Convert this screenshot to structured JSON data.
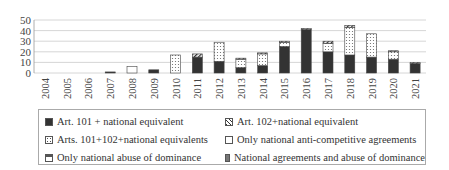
{
  "chart_data": {
    "type": "bar",
    "stacked": true,
    "title": "",
    "xlabel": "",
    "ylabel": "",
    "ylim": [
      0,
      50
    ],
    "yticks": [
      0,
      10,
      20,
      30,
      40,
      50
    ],
    "grid": true,
    "legend_position": "bottom",
    "categories": [
      "2004",
      "2005",
      "2006",
      "2007",
      "2008",
      "2009",
      "2010",
      "2011",
      "2012",
      "2013",
      "2014",
      "2015",
      "2016",
      "2017",
      "2018",
      "2019",
      "2020",
      "2021"
    ],
    "series": [
      {
        "name": "Art. 101 + national equivalent",
        "color": "#333333",
        "pattern": "solid",
        "values": [
          0,
          0,
          0,
          1,
          0,
          3,
          0,
          15,
          11,
          5,
          7,
          25,
          41,
          20,
          17,
          15,
          13,
          9
        ]
      },
      {
        "name": "Arts. 101+102+national equivalents",
        "color": "#ffffff",
        "pattern": "dotted",
        "values": [
          0,
          0,
          0,
          0,
          0,
          0,
          17,
          0,
          18,
          8,
          11,
          4,
          0,
          8,
          26,
          22,
          7,
          0
        ]
      },
      {
        "name": "Art. 102+national equivalent",
        "color": "#333333",
        "pattern": "hatched",
        "values": [
          0,
          0,
          0,
          0,
          0,
          0,
          0,
          3,
          0,
          1,
          1,
          1,
          1,
          2,
          2,
          0,
          1,
          1
        ]
      },
      {
        "name": "Only national anti-competitive agreements",
        "color": "#ffffff",
        "pattern": "empty",
        "values": [
          0,
          0,
          0,
          0,
          6,
          0,
          0,
          0,
          0,
          0,
          0,
          0,
          0,
          0,
          0,
          0,
          0,
          0
        ]
      },
      {
        "name": "Only national abuse of dominance",
        "color": "#ffffff",
        "pattern": "top-band",
        "values": [
          0,
          0,
          0,
          0,
          0,
          0,
          0,
          0,
          0,
          0,
          0,
          0,
          0,
          0,
          0,
          0,
          0,
          0
        ]
      },
      {
        "name": "National agreements and abuse of dominance",
        "color": "#777777",
        "pattern": "solid",
        "values": [
          0,
          0,
          0,
          0,
          0,
          0,
          0,
          0,
          0,
          0,
          0,
          0,
          0,
          0,
          0,
          0,
          0,
          0
        ]
      }
    ]
  },
  "legend": [
    {
      "label": "Art. 101 + national equivalent",
      "swatch": "dark"
    },
    {
      "label": "Art. 102+national equivalent",
      "swatch": "hatch"
    },
    {
      "label": "Arts. 101+102+national equivalents",
      "swatch": "dot"
    },
    {
      "label": "Only national anti-competitive agreements",
      "swatch": "white"
    },
    {
      "label": "Only national abuse of dominance",
      "swatch": "abuse"
    },
    {
      "label": "National agreements and abuse of dominance",
      "swatch": "grey"
    }
  ]
}
